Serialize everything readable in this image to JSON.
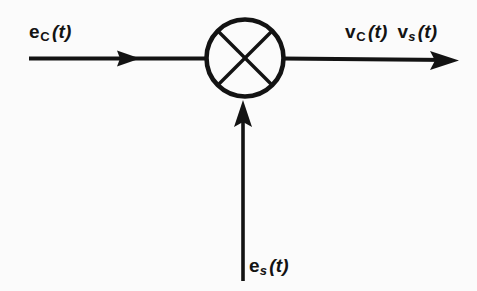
{
  "diagram": {
    "type": "block-diagram",
    "background_color": "#fbfbfb",
    "stroke_color": "#131313",
    "nodes": [
      {
        "name": "mixer",
        "symbol": "circle-with-x",
        "center_x": 245,
        "center_y": 58,
        "radius": 39
      }
    ],
    "signals": {
      "input_left": {
        "base": "e",
        "subscript": "C",
        "argument": "(t)",
        "full": "e_C(t)",
        "direction": "into-mixer-from-left"
      },
      "input_bottom": {
        "base": "e",
        "subscript": "s",
        "argument": "(t)",
        "full": "e_s(t)",
        "direction": "into-mixer-from-below"
      },
      "output_right_1": {
        "base": "v",
        "subscript": "C",
        "argument": "(t)",
        "full": "v_C(t)",
        "direction": "out-of-mixer-to-right"
      },
      "output_right_2": {
        "base": "v",
        "subscript": "s",
        "argument": "(t)",
        "full": "v_s(t)",
        "direction": "out-of-mixer-to-right"
      }
    },
    "arrows": [
      {
        "name": "left-input-arrow",
        "from_x": 29,
        "from_y": 58,
        "to_x": 206,
        "to_y": 58,
        "head_at_x": 140,
        "head_at_y": 58
      },
      {
        "name": "right-output-arrow",
        "from_x": 284,
        "from_y": 58,
        "to_x": 458,
        "to_y": 60,
        "head_at_x": 458,
        "head_at_y": 60
      },
      {
        "name": "bottom-input-arrow",
        "from_x": 243,
        "from_y": 280,
        "to_x": 243,
        "to_y": 101,
        "head_at_x": 243,
        "head_at_y": 101
      }
    ]
  }
}
